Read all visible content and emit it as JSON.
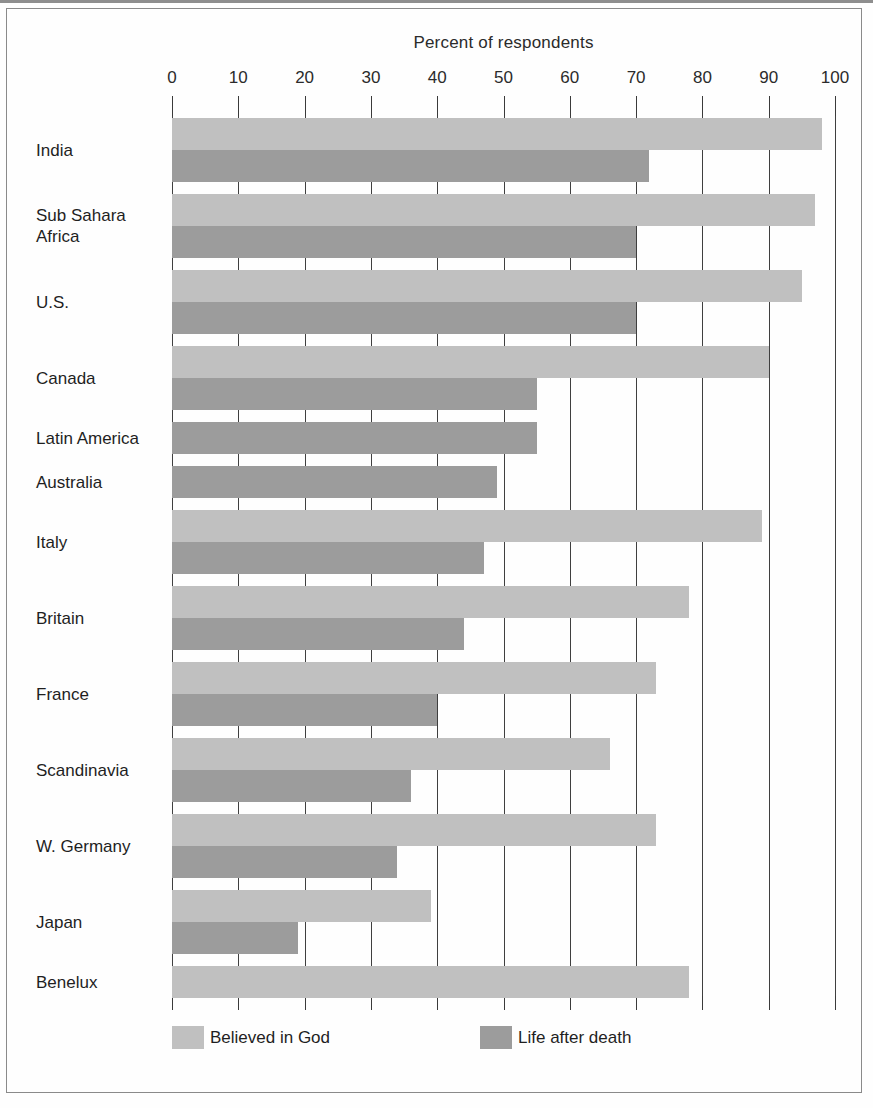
{
  "figure": {
    "title": "Percent of respondents"
  },
  "legend": [
    {
      "label": "Believed in God",
      "color": "#c0c0c0",
      "key": "god"
    },
    {
      "label": "Life after death",
      "color": "#9c9c9c",
      "key": "afterlife"
    }
  ],
  "axis": {
    "ticks": [
      "0",
      "10",
      "20",
      "30",
      "40",
      "50",
      "60",
      "70",
      "80",
      "90",
      "100"
    ]
  },
  "chart_data": {
    "type": "bar",
    "orientation": "horizontal",
    "title": "Percent of respondents",
    "xlabel": "Percent of respondents",
    "ylabel": "",
    "xlim": [
      0,
      100
    ],
    "xticks": [
      0,
      10,
      20,
      30,
      40,
      50,
      60,
      70,
      80,
      90,
      100
    ],
    "grid": true,
    "legend_position": "bottom",
    "colors": {
      "god": "#c0c0c0",
      "afterlife": "#9c9c9c"
    },
    "categories": [
      "India",
      "Sub Sahara\nAfrica",
      "U.S.",
      "Canada",
      "Latin America",
      "Australia",
      "Italy",
      "Britain",
      "France",
      "Scandinavia",
      "W. Germany",
      "Japan",
      "Benelux"
    ],
    "series": [
      {
        "name": "Believed in God",
        "color": "#c0c0c0",
        "values": [
          98,
          97,
          95,
          90,
          null,
          null,
          89,
          78,
          73,
          66,
          73,
          39,
          78
        ]
      },
      {
        "name": "Life after death",
        "color": "#9c9c9c",
        "values": [
          72,
          70,
          70,
          55,
          55,
          49,
          47,
          44,
          40,
          36,
          34,
          19,
          null
        ]
      }
    ]
  },
  "bars": [
    {
      "label": "India",
      "god": 98,
      "afterlife": 72
    },
    {
      "label": "Sub Sahara\nAfrica",
      "god": 97,
      "afterlife": 70
    },
    {
      "label": "U.S.",
      "god": 95,
      "afterlife": 70
    },
    {
      "label": "Canada",
      "god": 90,
      "afterlife": 55
    },
    {
      "label": "Latin America",
      "god": null,
      "afterlife": 55
    },
    {
      "label": "Australia",
      "god": null,
      "afterlife": 49
    },
    {
      "label": "Italy",
      "god": 89,
      "afterlife": 47
    },
    {
      "label": "Britain",
      "god": 78,
      "afterlife": 44
    },
    {
      "label": "France",
      "god": 73,
      "afterlife": 40
    },
    {
      "label": "Scandinavia",
      "god": 66,
      "afterlife": 36
    },
    {
      "label": "W. Germany",
      "god": 73,
      "afterlife": 34
    },
    {
      "label": "Japan",
      "god": 39,
      "afterlife": 19
    },
    {
      "label": "Benelux",
      "god": 78,
      "afterlife": null
    }
  ]
}
